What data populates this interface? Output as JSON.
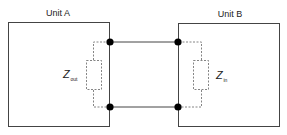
{
  "diagram": {
    "unit_a": {
      "label": "Unit A",
      "impedance_main": "Z",
      "impedance_sub": "out"
    },
    "unit_b": {
      "label": "Unit B",
      "impedance_main": "Z",
      "impedance_sub": "in"
    },
    "colors": {
      "line": "#444444",
      "dashed": "#666666",
      "node": "#000000",
      "text": "#222222"
    }
  }
}
